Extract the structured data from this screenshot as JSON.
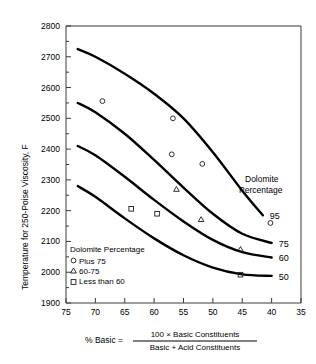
{
  "chart_data": {
    "type": "line",
    "title": "",
    "xlabel": "% Basic",
    "ylabel": "Temperature for 250-Poise Viscosity, F",
    "xlim": [
      75,
      35
    ],
    "ylim": [
      1900,
      2800
    ],
    "x_ticks": [
      75,
      70,
      65,
      60,
      55,
      50,
      45,
      40,
      35
    ],
    "y_ticks": [
      1900,
      2000,
      2100,
      2200,
      2300,
      2400,
      2500,
      2600,
      2700,
      2800
    ],
    "y_minor_ticks": [
      1950,
      2050,
      2150,
      2250,
      2350,
      2450,
      2550,
      2650,
      2750
    ],
    "x_axis_reversed": true,
    "grid": false,
    "legend_position": "inside-lower-left",
    "series": [
      {
        "name": "95",
        "label": "95",
        "points": [
          {
            "x": 73.0,
            "y": 2725
          },
          {
            "x": 70.0,
            "y": 2700
          },
          {
            "x": 65.0,
            "y": 2645
          },
          {
            "x": 60.0,
            "y": 2580
          },
          {
            "x": 55.0,
            "y": 2500
          },
          {
            "x": 50.0,
            "y": 2390
          },
          {
            "x": 45.0,
            "y": 2265
          },
          {
            "x": 41.5,
            "y": 2185
          }
        ]
      },
      {
        "name": "75",
        "label": "75",
        "points": [
          {
            "x": 73.0,
            "y": 2550
          },
          {
            "x": 70.0,
            "y": 2520
          },
          {
            "x": 65.0,
            "y": 2450
          },
          {
            "x": 60.0,
            "y": 2365
          },
          {
            "x": 55.0,
            "y": 2275
          },
          {
            "x": 50.0,
            "y": 2190
          },
          {
            "x": 45.0,
            "y": 2125
          },
          {
            "x": 40.0,
            "y": 2095
          }
        ]
      },
      {
        "name": "60",
        "label": "60",
        "points": [
          {
            "x": 73.0,
            "y": 2410
          },
          {
            "x": 70.0,
            "y": 2380
          },
          {
            "x": 65.0,
            "y": 2310
          },
          {
            "x": 60.0,
            "y": 2235
          },
          {
            "x": 55.0,
            "y": 2165
          },
          {
            "x": 50.0,
            "y": 2105
          },
          {
            "x": 45.0,
            "y": 2065
          },
          {
            "x": 40.0,
            "y": 2048
          }
        ]
      },
      {
        "name": "50",
        "label": "50",
        "points": [
          {
            "x": 73.0,
            "y": 2280
          },
          {
            "x": 70.0,
            "y": 2245
          },
          {
            "x": 65.0,
            "y": 2175
          },
          {
            "x": 60.0,
            "y": 2110
          },
          {
            "x": 55.0,
            "y": 2055
          },
          {
            "x": 50.0,
            "y": 2015
          },
          {
            "x": 45.0,
            "y": 1993
          },
          {
            "x": 40.0,
            "y": 1988
          }
        ]
      }
    ],
    "scatter_groups": [
      {
        "name": "Plus 75",
        "marker": "circle",
        "points": [
          {
            "x": 68.8,
            "y": 2556
          },
          {
            "x": 56.8,
            "y": 2500
          },
          {
            "x": 57.0,
            "y": 2383
          },
          {
            "x": 51.8,
            "y": 2352
          },
          {
            "x": 40.2,
            "y": 2160
          }
        ]
      },
      {
        "name": "60-75",
        "marker": "triangle",
        "points": [
          {
            "x": 56.2,
            "y": 2270
          },
          {
            "x": 52.0,
            "y": 2172
          },
          {
            "x": 45.3,
            "y": 2075
          }
        ]
      },
      {
        "name": "Less than 60",
        "marker": "square",
        "points": [
          {
            "x": 63.9,
            "y": 2206
          },
          {
            "x": 59.5,
            "y": 2190
          },
          {
            "x": 45.3,
            "y": 1992
          }
        ]
      }
    ],
    "annotations": {
      "side_note_line1": "Dolomite",
      "side_note_line2": "Percentage",
      "curve_labels": [
        "95",
        "75",
        "60",
        "50"
      ]
    }
  },
  "axes": {
    "y_title": "Temperature for 250-Poise Viscosity, F",
    "y_tick_labels": [
      "2800",
      "2700",
      "2600",
      "2500",
      "2400",
      "2300",
      "2200",
      "2100",
      "2000",
      "1900"
    ],
    "x_tick_labels": [
      "75",
      "70",
      "65",
      "60",
      "55",
      "50",
      "45",
      "40",
      "35"
    ]
  },
  "legend": {
    "title": "Dolomite Percentage",
    "items": [
      {
        "marker": "circle",
        "label": "Plus 75"
      },
      {
        "marker": "triangle",
        "label": "60-75"
      },
      {
        "marker": "square",
        "label": "Less than 60"
      }
    ]
  },
  "caption": {
    "lhs": "% Basic =",
    "numerator": "100 × Basic Constituents",
    "denominator": "Basic + Acid Constituents"
  },
  "colors": {
    "curve": "#000000",
    "axis": "#3a3a3a",
    "text": "#000000",
    "background": "#ffffff"
  }
}
